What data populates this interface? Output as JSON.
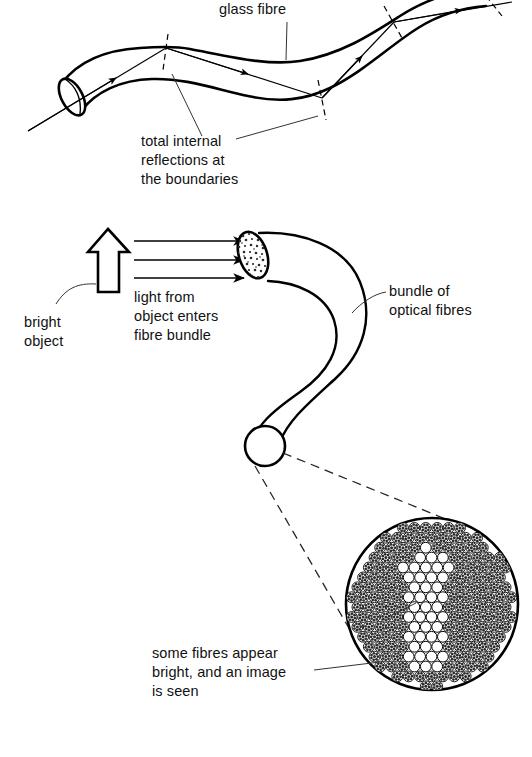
{
  "figure": {
    "background_color": "#ffffff",
    "ink_color": "#000000"
  },
  "labels": {
    "glass_fibre": "glass fibre",
    "total_internal_line1": "total internal",
    "total_internal_line2": "reflections at",
    "total_internal_line3": "the boundaries",
    "bright_object_line1": "bright",
    "bright_object_line2": "object",
    "light_from_line1": "light from",
    "light_from_line2": "object enters",
    "light_from_line3": "fibre bundle",
    "bundle_line1": "bundle of",
    "bundle_line2": "optical fibres",
    "some_fibres_line1": "some fibres appear",
    "some_fibres_line2": "bright, and an image",
    "some_fibres_line3": "is seen"
  },
  "icons": {
    "object_arrow": "up-arrow-icon",
    "ray_arrowhead": "arrowhead-icon",
    "fibre_end_face": "speckled-ellipse-icon",
    "magnified_disc": "fibre-bundle-cross-section-icon"
  },
  "diagram": {
    "panel_top": {
      "name": "total-internal-reflection-panel",
      "ray_bounce_count": 3,
      "description": "single glass fibre with light ray undergoing total internal reflections"
    },
    "panel_middle": {
      "name": "fibre-bundle-panel",
      "light_ray_count": 3,
      "description": "bright arrow object emitting light into a bundle of optical fibres"
    },
    "panel_bottom": {
      "name": "magnified-cross-section-panel",
      "description": "magnified end of bundle showing bright fibres forming an arrow image"
    }
  }
}
